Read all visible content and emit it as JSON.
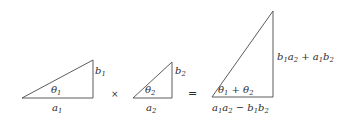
{
  "figure": {
    "background_color": "#ffffff",
    "line_color": "#4a4a4a",
    "text_color": "#2b2b2b"
  },
  "operators": {
    "times": "×",
    "equals": "="
  },
  "triangles": [
    {
      "name": "factor-1",
      "angle_label": "θ",
      "angle_sub": "1",
      "vertical_label": "b",
      "vertical_sub": "1",
      "base_label": "a",
      "base_sub": "1",
      "vertices": {
        "left": [
          22,
          98
        ],
        "apex": [
          93,
          60
        ],
        "right": [
          93,
          98
        ]
      }
    },
    {
      "name": "factor-2",
      "angle_label": "θ",
      "angle_sub": "2",
      "vertical_label": "b",
      "vertical_sub": "2",
      "base_label": "a",
      "base_sub": "2",
      "vertices": {
        "left": [
          133,
          98
        ],
        "apex": [
          172,
          62
        ],
        "right": [
          172,
          98
        ]
      }
    },
    {
      "name": "product",
      "angle_expression": "θ₁ + θ₂",
      "vertical_expression": "b₁a₂ + a₁b₂",
      "base_expression": "a₁a₂ − b₁b₂",
      "vertices": {
        "left": [
          212,
          97
        ],
        "apex": [
          273,
          11
        ],
        "right": [
          273,
          97
        ]
      }
    }
  ],
  "labels": {
    "t1_theta_base": "θ",
    "t1_theta_sub": "1",
    "t1_b_base": "b",
    "t1_b_sub": "1",
    "t1_a_base": "a",
    "t1_a_sub": "1",
    "t2_theta_base": "θ",
    "t2_theta_sub": "2",
    "t2_b_base": "b",
    "t2_b_sub": "2",
    "t2_a_base": "a",
    "t2_a_sub": "2",
    "t3_theta_p1": "θ",
    "t3_theta_p1_sub": "1",
    "t3_theta_plus": " + ",
    "t3_theta_p2": "θ",
    "t3_theta_p2_sub": "2",
    "t3_b_p1": "b",
    "t3_b_p1_sub": "1",
    "t3_b_p2": "a",
    "t3_b_p2_sub": "2",
    "t3_b_plus": " + ",
    "t3_b_p3": "a",
    "t3_b_p3_sub": "1",
    "t3_b_p4": "b",
    "t3_b_p4_sub": "2",
    "t3_a_p1": "a",
    "t3_a_p1_sub": "1",
    "t3_a_p2": "a",
    "t3_a_p2_sub": "2",
    "t3_a_minus": " − ",
    "t3_a_p3": "b",
    "t3_a_p3_sub": "1",
    "t3_a_p4": "b",
    "t3_a_p4_sub": "2"
  }
}
